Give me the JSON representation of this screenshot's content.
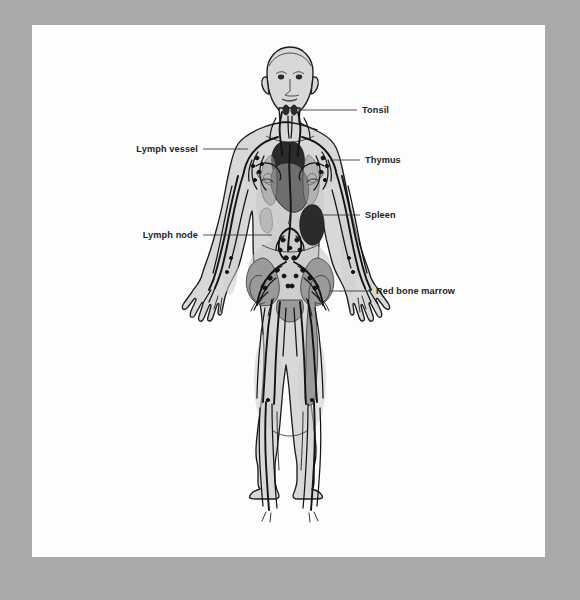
{
  "page": {
    "background_color": "#a9a9a9",
    "sheet_color": "#fdfdfd"
  },
  "figure": {
    "system": "lymphatic system",
    "ink_color": "#141414",
    "body_fill": "#d8d8d8"
  },
  "labels": [
    {
      "id": "tonsil",
      "text": "Tonsil",
      "text_x": 362,
      "text_y": 113,
      "anchor": "start",
      "leader": "M 298 110 L 357 110",
      "target_organ": "tonsil"
    },
    {
      "id": "lymph-vessel",
      "text": "Lymph vessel",
      "text_x": 198,
      "text_y": 152,
      "anchor": "end",
      "leader": "M 203 149 L 248 149",
      "target_organ": "lymph vessel"
    },
    {
      "id": "thymus",
      "text": "Thymus",
      "text_x": 365,
      "text_y": 163,
      "anchor": "start",
      "leader": "M 330 160 L 360 160",
      "target_organ": "thymus"
    },
    {
      "id": "spleen",
      "text": "Spleen",
      "text_x": 365,
      "text_y": 218,
      "anchor": "start",
      "leader": "M 318 215 L 360 215",
      "target_organ": "spleen"
    },
    {
      "id": "lymph-node",
      "text": "Lymph node",
      "text_x": 198,
      "text_y": 238,
      "anchor": "end",
      "leader": "M 203 235 L 272 235",
      "target_organ": "lymph node"
    },
    {
      "id": "red-bone-marrow",
      "text": "Red bone marrow",
      "text_x": 376,
      "text_y": 294,
      "anchor": "start",
      "leader": "M 330 291 L 371 291",
      "target_organ": "red bone marrow"
    }
  ]
}
